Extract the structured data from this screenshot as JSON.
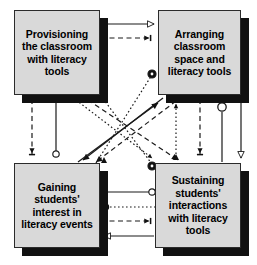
{
  "diagram": {
    "type": "influence-diagram",
    "background_color": "#ffffff",
    "node_fill_color": "#d9d9d9",
    "node_border_color": "#2b2b2b",
    "node_shadow_color": "#111111",
    "edge_color": "#1a1a1a",
    "nodes": [
      {
        "id": "provisioning",
        "label": "Provisioning the classroom with literacy tools",
        "x": 14,
        "y": 10,
        "w": 86,
        "h": 85
      },
      {
        "id": "arranging",
        "label": "Arranging classroom space and literacy tools",
        "x": 158,
        "y": 10,
        "w": 83,
        "h": 85
      },
      {
        "id": "gaining",
        "label": "Gaining students' interest in literacy events",
        "x": 14,
        "y": 163,
        "w": 86,
        "h": 85
      },
      {
        "id": "sustaining",
        "label": "Sustaining students' interactions with literacy tools",
        "x": 155,
        "y": 163,
        "w": 86,
        "h": 85
      }
    ],
    "edges": [
      {
        "id": "e1",
        "from": "provisioning",
        "to": "arranging",
        "style": "solid",
        "marker": "open-triangle"
      },
      {
        "id": "e2",
        "from": "provisioning",
        "to": "arranging",
        "style": "dashed",
        "marker": "crossbar-arrow"
      },
      {
        "id": "e3",
        "from": "provisioning",
        "to": "gaining",
        "style": "dashed",
        "marker": "crossbar-arrow"
      },
      {
        "id": "e4",
        "from": "provisioning",
        "to": "gaining",
        "style": "solid",
        "marker": "open-circle"
      },
      {
        "id": "e5",
        "from": "arranging",
        "to": "sustaining",
        "style": "dashed",
        "marker": "crossbar-arrow"
      },
      {
        "id": "e6",
        "from": "arranging",
        "to": "sustaining",
        "style": "solid",
        "marker": "open-circle"
      },
      {
        "id": "e7",
        "from": "arranging",
        "to": "sustaining",
        "style": "solid",
        "marker": "open-triangle"
      },
      {
        "id": "e8",
        "from": "gaining",
        "to": "sustaining",
        "style": "solid",
        "marker": "open-circle"
      },
      {
        "id": "e9",
        "from": "gaining",
        "to": "sustaining",
        "style": "dotted",
        "marker": "circle-dot"
      },
      {
        "id": "e10",
        "from": "gaining",
        "to": "sustaining",
        "style": "dashed",
        "marker": "crossbar-arrow"
      },
      {
        "id": "e11",
        "from": "sustaining",
        "to": "gaining",
        "style": "solid",
        "marker": "open-triangle"
      },
      {
        "id": "e12",
        "from": "provisioning",
        "to": "sustaining",
        "style": "dashed",
        "marker": "filled-arrow"
      },
      {
        "id": "e13",
        "from": "provisioning",
        "to": "sustaining",
        "style": "dotted",
        "marker": "filled-triangle"
      },
      {
        "id": "e14",
        "from": "arranging",
        "to": "gaining",
        "style": "solid",
        "marker": "filled-arrow"
      },
      {
        "id": "e15",
        "from": "arranging",
        "to": "gaining",
        "style": "dotted",
        "marker": "filled-triangle"
      },
      {
        "id": "e16",
        "from": "gaining",
        "to": "arranging",
        "style": "solid",
        "marker": "filled-arrow"
      },
      {
        "id": "e17",
        "from": "sustaining",
        "to": "arranging",
        "style": "dotted",
        "marker": "filled-triangle"
      },
      {
        "id": "e18",
        "from": "sustaining",
        "to": "provisioning",
        "style": "dotted",
        "marker": "circle-dot"
      }
    ]
  }
}
